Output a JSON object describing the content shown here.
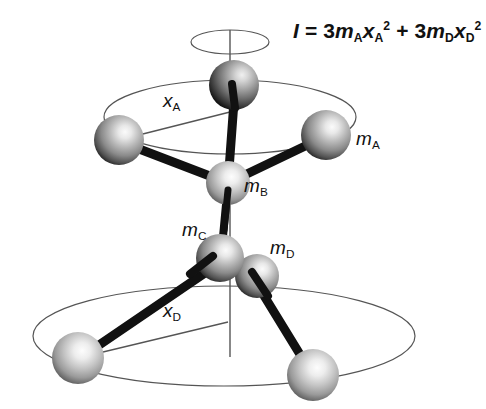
{
  "figure": {
    "background_color": "#ffffff",
    "formula": {
      "symbol_I": "I",
      "equals": "=",
      "term1_coeff": "3",
      "term1_mass": "m",
      "term1_mass_sub": "A",
      "term1_radius": "x",
      "term1_radius_sub": "A",
      "term1_exp": "2",
      "plus": "+",
      "term2_coeff": "3",
      "term2_mass": "m",
      "term2_mass_sub": "D",
      "term2_radius": "x",
      "term2_radius_sub": "D",
      "term2_exp": "2",
      "plain_text": "I = 3mAxA2 + 3mDxD2"
    },
    "labels": [
      {
        "id": "m-a",
        "base": "m",
        "sub": "A",
        "x": 356,
        "y": 128
      },
      {
        "id": "m-b",
        "base": "m",
        "sub": "B",
        "x": 244,
        "y": 175
      },
      {
        "id": "m-c",
        "base": "m",
        "sub": "C",
        "x": 182,
        "y": 219
      },
      {
        "id": "m-d",
        "base": "m",
        "sub": "D",
        "x": 270,
        "y": 237
      },
      {
        "id": "x-a",
        "base": "x",
        "sub": "A",
        "x": 163,
        "y": 90
      },
      {
        "id": "x-d",
        "base": "x",
        "sub": "D",
        "x": 163,
        "y": 300
      }
    ],
    "geometry": {
      "axis": {
        "x": 230,
        "y_top": 30,
        "y_bottom": 357,
        "color": "#555555",
        "width": 1.4
      },
      "top_small_ellipse": {
        "cx": 230,
        "cy": 42,
        "rx": 39,
        "ry": 12,
        "color": "#555555"
      },
      "upper_orbit_ellipse": {
        "cx": 230,
        "cy": 117,
        "rx": 126,
        "ry": 37,
        "color": "#555555"
      },
      "lower_orbit_ellipse": {
        "cx": 224,
        "cy": 336,
        "rx": 191,
        "ry": 50,
        "color": "#555555"
      },
      "spheres": [
        {
          "id": "sphere-a-top",
          "label": "m_A",
          "cx": 234,
          "cy": 85,
          "r": 25
        },
        {
          "id": "sphere-a-left",
          "label": "m_A",
          "cx": 119,
          "cy": 140,
          "r": 25
        },
        {
          "id": "sphere-a-right",
          "label": "m_A",
          "cx": 326,
          "cy": 135,
          "r": 25
        },
        {
          "id": "sphere-b-center",
          "label": "m_B",
          "cx": 228,
          "cy": 183,
          "r": 22
        },
        {
          "id": "sphere-c-center",
          "label": "m_C",
          "cx": 220,
          "cy": 258,
          "r": 24
        },
        {
          "id": "sphere-d-right",
          "label": "m_D",
          "cx": 257,
          "cy": 276,
          "r": 22
        },
        {
          "id": "sphere-d-left",
          "label": "m_D",
          "cx": 78,
          "cy": 358,
          "r": 26
        },
        {
          "id": "sphere-d-lower",
          "label": "m_D",
          "cx": 313,
          "cy": 375,
          "r": 26
        }
      ],
      "bonds": [
        {
          "id": "bond-b-to-a-top",
          "from": "sphere-b-center",
          "to": "sphere-a-top",
          "width": 9
        },
        {
          "id": "bond-b-to-a-left",
          "from": "sphere-b-center",
          "to": "sphere-a-left",
          "width": 9
        },
        {
          "id": "bond-b-to-a-right",
          "from": "sphere-b-center",
          "to": "sphere-a-right",
          "width": 9
        },
        {
          "id": "bond-b-to-c",
          "from": "sphere-b-center",
          "to": "sphere-c-center",
          "width": 8
        },
        {
          "id": "bond-c-to-d-right",
          "from": "sphere-c-center",
          "to": "sphere-d-right",
          "width": 8
        },
        {
          "id": "bond-c-to-d-left",
          "from": "sphere-c-center",
          "to": "sphere-d-left",
          "width": 9
        },
        {
          "id": "bond-d-to-lower",
          "from": "sphere-d-right",
          "to": "sphere-d-lower",
          "width": 9
        }
      ],
      "radius_lines": [
        {
          "id": "radius-x-a",
          "x1": 119,
          "y1": 140,
          "x2": 230,
          "y2": 112,
          "color": "#555555"
        },
        {
          "id": "radius-x-d",
          "x1": 78,
          "y1": 358,
          "x2": 228,
          "y2": 322,
          "color": "#555555"
        }
      ]
    },
    "colors": {
      "sphere_highlight": "#f2f2f2",
      "sphere_mid": "#9a9a9a",
      "sphere_dark": "#2a2a2a",
      "bond": "#111111",
      "outline": "#555555",
      "text": "#111111"
    }
  }
}
